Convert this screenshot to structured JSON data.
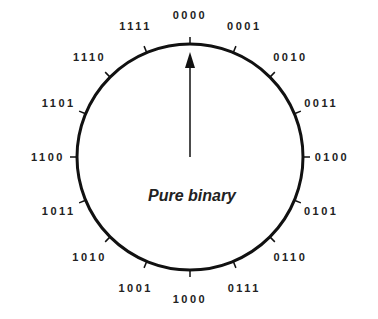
{
  "diagram": {
    "title": "Pure binary",
    "center": [
      190,
      157
    ],
    "radius": 113,
    "colors": {
      "stroke": "#111111",
      "text": "#222222",
      "background": "#ffffff"
    },
    "pointer": {
      "direction": "up",
      "points_to": "0000"
    },
    "codes": [
      "0000",
      "0001",
      "0010",
      "0011",
      "0100",
      "0101",
      "0110",
      "0111",
      "1000",
      "1001",
      "1010",
      "1011",
      "1100",
      "1101",
      "1110",
      "1111"
    ]
  }
}
